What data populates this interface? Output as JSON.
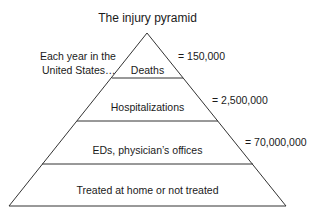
{
  "diagram": {
    "title": "The injury pyramid",
    "annotation_line1": "Each year in the",
    "annotation_line2": "United States…",
    "levels": [
      {
        "label": "Deaths",
        "count": "= 150,000"
      },
      {
        "label": "Hospitalizations",
        "count": "= 2,500,000"
      },
      {
        "label": "EDs, physician’s offices",
        "count": "= 70,000,000"
      },
      {
        "label": "Treated at home or not treated",
        "count": ""
      }
    ],
    "line_color": "#333333"
  }
}
